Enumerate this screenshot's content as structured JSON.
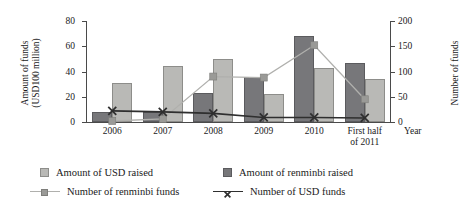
{
  "chart_data": {
    "type": "bar",
    "title": "",
    "xlabel": "Year",
    "categories": [
      "2006",
      "2007",
      "2008",
      "2009",
      "2010",
      "First half\nof 2011"
    ],
    "left_axis": {
      "label": "Amount of funds\n(USD100 million)",
      "ticks": [
        "0",
        "20",
        "40",
        "60",
        "80"
      ],
      "tick_values": [
        0,
        20,
        40,
        60,
        80
      ],
      "ylim": [
        0,
        80
      ]
    },
    "right_axis": {
      "label": "Number of funds",
      "ticks": [
        "0",
        "50",
        "100",
        "150",
        "200"
      ],
      "tick_values": [
        0,
        50,
        100,
        150,
        200
      ],
      "ylim": [
        0,
        200
      ]
    },
    "grid": false,
    "legend_position": "bottom",
    "series": [
      {
        "name": "Amount of USD raised",
        "kind": "bar",
        "axis": "left",
        "color": "#b9b9b6",
        "values": [
          31,
          44,
          50,
          22,
          43,
          34
        ]
      },
      {
        "name": "Amount of renminbi raised",
        "kind": "bar",
        "axis": "left",
        "color": "#77777a",
        "values": [
          8,
          8,
          23,
          36,
          68,
          47
        ]
      },
      {
        "name": "Number of renminbi funds",
        "kind": "line",
        "axis": "right",
        "color": "#b0b0ad",
        "marker": "square",
        "values": [
          2,
          6,
          90,
          88,
          152,
          45
        ]
      },
      {
        "name": "Number of USD funds",
        "kind": "line",
        "axis": "right",
        "color": "#2f2f2f",
        "marker": "x",
        "values": [
          22,
          20,
          17,
          9,
          9,
          8
        ]
      }
    ]
  },
  "legend": {
    "items": [
      {
        "label": "Amount of USD raised",
        "type": "swatch-usd"
      },
      {
        "label": "Amount of renminbi raised",
        "type": "swatch-rmb"
      },
      {
        "label": "Number of renminbi funds",
        "type": "line-rmb"
      },
      {
        "label": "Number of USD funds",
        "type": "line-usd"
      }
    ]
  }
}
